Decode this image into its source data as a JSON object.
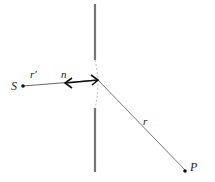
{
  "diagram": {
    "title": "",
    "labels": {
      "source": "S",
      "point": "P",
      "r_prime": "r′",
      "normal": "n",
      "r": "r"
    },
    "colors": {
      "screen": "#777777",
      "line": "#555555",
      "arrow": "#111111",
      "dash": "#aaaaaa"
    }
  }
}
